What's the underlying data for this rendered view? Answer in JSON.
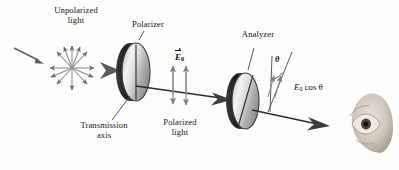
{
  "figure": {
    "kind": "optics-diagram",
    "background_color": "#fdfdfb",
    "ink_color": "#1a1a1a"
  },
  "labels": {
    "unpolarized_light": "Unpolarized\nlight",
    "polarizer": "Polarizer",
    "analyzer": "Analyzer",
    "transmission_axis": "Transmission\naxis",
    "polarized_light": "Polarized\nlight",
    "e_field_symbol": "E",
    "e_field_subscript": "0",
    "theta_symbol": "θ",
    "transmitted_amplitude_prefix": "E",
    "transmitted_amplitude_subscript": "0",
    "transmitted_amplitude_suffix": " cos θ"
  },
  "elements": {
    "incoming_ray": "incoming-light-ray",
    "starburst": "unpolarized-light-starburst",
    "beam_arrow": "beam-arrow",
    "polarizer_disc": "polarizer-disc",
    "analyzer_disc": "analyzer-disc",
    "polarized_arrows": "polarized-light-double-arrows",
    "transmitted_arrows": "transmitted-light-double-arrows",
    "eye": "observer-eye"
  },
  "colors": {
    "disc_light": "#f2f2f2",
    "disc_mid": "#b9b9b9",
    "disc_dark": "#6d6d6d",
    "disc_rim": "#2e2e2e",
    "arrow_gray": "#7b7b7b",
    "arrow_dark": "#4a4a4a"
  }
}
